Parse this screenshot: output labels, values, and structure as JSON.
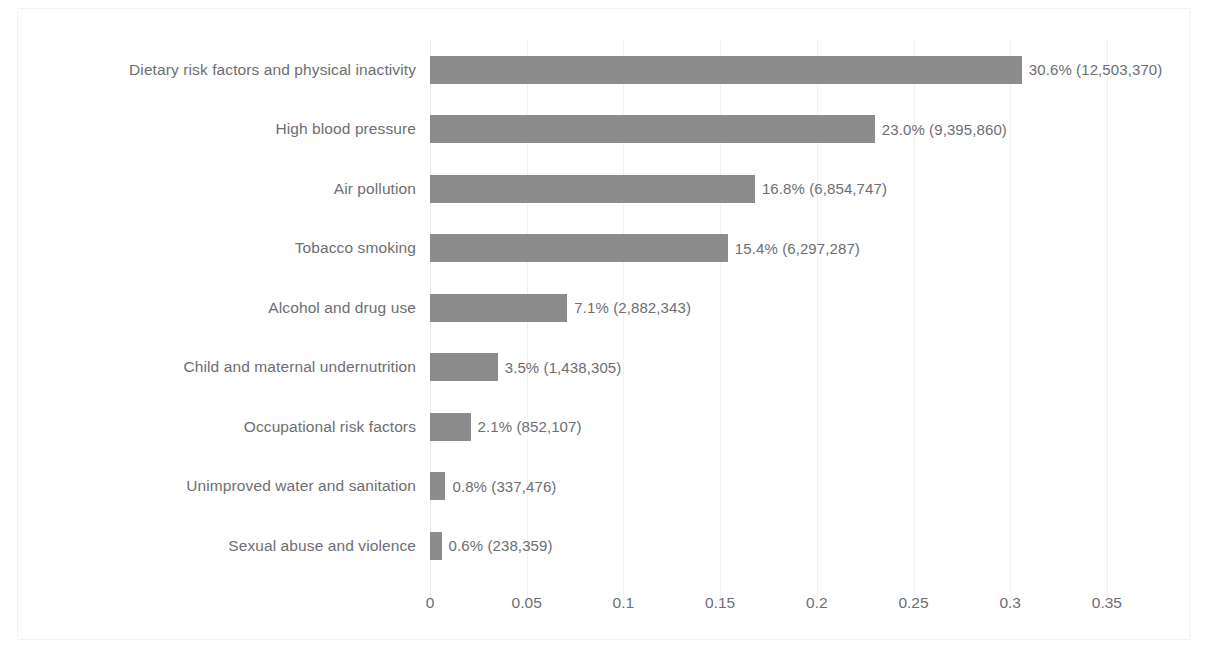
{
  "chart_data": {
    "type": "bar",
    "orientation": "horizontal",
    "title": "",
    "subtitle": "",
    "xlabel": "",
    "ylabel": "",
    "xlim": [
      0,
      0.385
    ],
    "grid": "vertical-light",
    "legend": "none",
    "bar_color": "#8c8c8c",
    "text_color": "#6d6e71",
    "background_color": "#ffffff",
    "xticks": [
      0,
      0.05,
      0.1,
      0.15,
      0.2,
      0.25,
      0.3,
      0.35
    ],
    "xtick_labels": [
      "0",
      "0.05",
      "0.1",
      "0.15",
      "0.2",
      "0.25",
      "0.3",
      "0.35"
    ],
    "categories": [
      "Dietary risk factors and physical inactivity",
      "High blood pressure",
      "Air pollution",
      "Tobacco smoking",
      "Alcohol and drug use",
      "Child and maternal undernutrition",
      "Occupational risk factors",
      "Unimproved water and sanitation",
      "Sexual abuse and violence"
    ],
    "values": [
      0.306,
      0.23,
      0.168,
      0.154,
      0.071,
      0.035,
      0.021,
      0.008,
      0.006
    ],
    "data_labels": [
      "30.6% (12,503,370)",
      "23.0% (9,395,860)",
      "16.8% (6,854,747)",
      "15.4% (6,297,287)",
      "7.1% (2,882,343)",
      "3.5% (1,438,305)",
      "2.1% (852,107)",
      "0.8% (337,476)",
      "0.6% (238,359)"
    ],
    "counts": [
      12503370,
      9395860,
      6854747,
      6297287,
      2882343,
      1438305,
      852107,
      337476,
      238359
    ],
    "percentages": [
      "30.6%",
      "23.0%",
      "16.8%",
      "15.4%",
      "7.1%",
      "3.5%",
      "2.1%",
      "0.8%",
      "0.6%"
    ]
  }
}
